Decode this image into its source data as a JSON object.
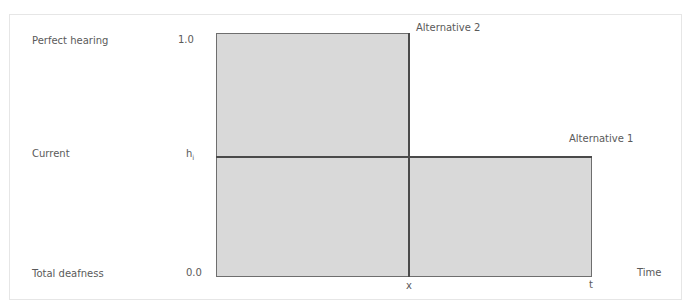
{
  "diagram": {
    "y_categories": {
      "top": "Perfect hearing",
      "middle": "Current",
      "bottom": "Total deafness"
    },
    "y_values": {
      "top": "1.0",
      "middle_base": "h",
      "middle_sub": "i",
      "bottom": "0.0"
    },
    "x_ticks": {
      "x": "x",
      "t": "t"
    },
    "x_axis_label": "Time",
    "alternatives": [
      {
        "label": "Alternative 2",
        "level": "1.0",
        "duration_end": "x"
      },
      {
        "label": "Alternative 1",
        "level": "h_i",
        "duration_end": "t"
      }
    ],
    "colors": {
      "fill": "#d9d9d9",
      "stroke": "#6e6e6e",
      "divider": "#4a4a4a",
      "text": "#5a5a5a"
    }
  }
}
